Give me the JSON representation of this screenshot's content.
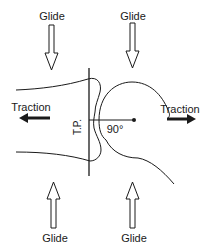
{
  "figure": {
    "labels": {
      "glide_top_left": "Glide",
      "glide_top_right": "Glide",
      "glide_bottom_left": "Glide",
      "glide_bottom_right": "Glide",
      "traction_left": "Traction",
      "traction_right": "Traction",
      "treatment_plane": "T.P.",
      "angle": "90°"
    },
    "colors": {
      "ink": "#1a1a1a",
      "background": "#ffffff"
    }
  }
}
